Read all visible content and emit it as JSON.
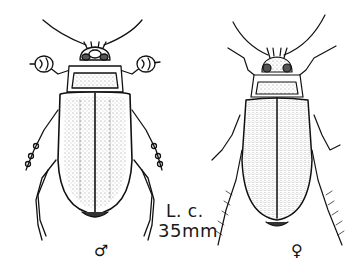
{
  "figure": {
    "type": "scientific-illustration",
    "labels": {
      "species_abbrev": "L. c.",
      "size": "35mm",
      "male_symbol": "♂",
      "female_symbol": "♀"
    },
    "specimens": [
      {
        "sex": "male",
        "position": "left",
        "elytra_texture": "smooth stippled"
      },
      {
        "sex": "female",
        "position": "right",
        "elytra_texture": "grooved stippled"
      }
    ],
    "colors": {
      "ink": "#111111",
      "paper": "#ffffff",
      "stipple": "#9a9a9a"
    }
  }
}
